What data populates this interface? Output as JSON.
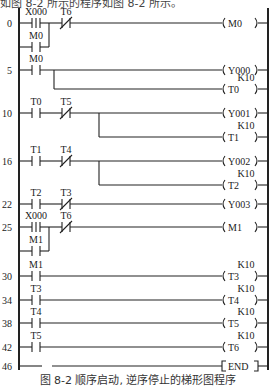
{
  "header_fragment": "如图 8-2 所示的程序如图 8-2 所示。",
  "caption": "图 8-2   顺序启动, 逆序停止的梯形图程序",
  "rungs": [
    {
      "step": "0",
      "contacts": [
        {
          "name": "X000",
          "type": "pulse"
        },
        {
          "name": "T6",
          "type": "NC"
        }
      ],
      "branch_contact": {
        "name": "M0",
        "type": "NO"
      },
      "outputs": [
        {
          "coil": "M0"
        }
      ]
    },
    {
      "step": "5",
      "contacts": [
        {
          "name": "M0",
          "type": "NO"
        }
      ],
      "outputs": [
        {
          "coil": "Y000"
        },
        {
          "coil": "T0",
          "setting": "K10"
        }
      ]
    },
    {
      "step": "10",
      "contacts": [
        {
          "name": "T0",
          "type": "NO"
        },
        {
          "name": "T5",
          "type": "NC"
        }
      ],
      "outputs": [
        {
          "coil": "Y001"
        },
        {
          "coil": "T1",
          "setting": "K10"
        }
      ]
    },
    {
      "step": "16",
      "contacts": [
        {
          "name": "T1",
          "type": "NO"
        },
        {
          "name": "T4",
          "type": "NC"
        }
      ],
      "outputs": [
        {
          "coil": "Y002"
        },
        {
          "coil": "T2",
          "setting": "K10"
        }
      ]
    },
    {
      "step": "22",
      "contacts": [
        {
          "name": "T2",
          "type": "NO"
        },
        {
          "name": "T3",
          "type": "NC"
        }
      ],
      "outputs": [
        {
          "coil": "Y003"
        }
      ]
    },
    {
      "step": "25",
      "contacts": [
        {
          "name": "X000",
          "type": "pulse"
        },
        {
          "name": "T6",
          "type": "NC"
        }
      ],
      "branch_contact": {
        "name": "M1",
        "type": "NO"
      },
      "outputs": [
        {
          "coil": "M1"
        }
      ]
    },
    {
      "step": "30",
      "contacts": [
        {
          "name": "M1",
          "type": "NO"
        }
      ],
      "outputs": [
        {
          "coil": "T3",
          "setting": "K10"
        }
      ]
    },
    {
      "step": "34",
      "contacts": [
        {
          "name": "T3",
          "type": "NO"
        }
      ],
      "outputs": [
        {
          "coil": "T4",
          "setting": "K10"
        }
      ]
    },
    {
      "step": "38",
      "contacts": [
        {
          "name": "T4",
          "type": "NO"
        }
      ],
      "outputs": [
        {
          "coil": "T5",
          "setting": "K10"
        }
      ]
    },
    {
      "step": "42",
      "contacts": [
        {
          "name": "T5",
          "type": "NO"
        }
      ],
      "outputs": [
        {
          "coil": "T6",
          "setting": "K10"
        }
      ]
    },
    {
      "step": "46",
      "contacts": [],
      "outputs": [
        {
          "instruction": "END"
        }
      ]
    }
  ],
  "colors": {
    "line": "#222222",
    "background": "#ffffff"
  }
}
